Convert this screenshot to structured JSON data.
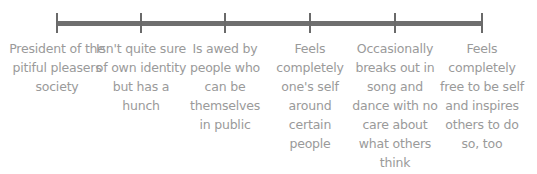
{
  "diagram": {
    "type": "spectrum-timeline",
    "line_color": "#6f6f6f",
    "text_color": "#9a9a9a",
    "points": [
      {
        "x": 57,
        "label": "President of the pitiful pleasers society"
      },
      {
        "x": 141,
        "label": "Isn't quite sure of own identity but has a hunch"
      },
      {
        "x": 225,
        "label": "Is awed by people who can be themselves in public"
      },
      {
        "x": 310,
        "label": "Feels completely one's self around certain people"
      },
      {
        "x": 395,
        "label": "Occasionally breaks out in song and dance with no care about what others think"
      },
      {
        "x": 482,
        "label": "Feels completely free to be self and inspires others to do so, too"
      }
    ]
  }
}
